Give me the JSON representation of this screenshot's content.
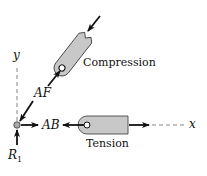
{
  "diagram": {
    "type": "free-body diagram",
    "axes": {
      "x_label": "x",
      "y_label": "y"
    },
    "forces": {
      "AF": "AF",
      "AB": "AB",
      "R1_base": "R",
      "R1_sub": "1"
    },
    "members": {
      "compression_label": "Compression",
      "tension_label": "Tension"
    },
    "colors": {
      "member_fill": "#c8c8c8",
      "stroke": "#111111",
      "axis": "#666666"
    }
  }
}
